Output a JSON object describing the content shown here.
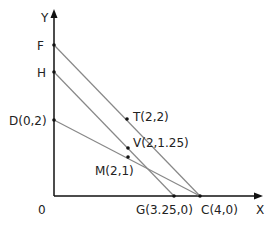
{
  "diagram": {
    "axes": {
      "x_label": "X",
      "y_label": "Y",
      "origin_label": "0"
    },
    "points": {
      "F": "F",
      "H": "H",
      "D": "D(0,2)",
      "T": "T(2,2)",
      "V": "V(2,1.25)",
      "M": "M(2,1)",
      "G": "G(3.25,0)",
      "C": "C(4,0)"
    },
    "lines": [
      {
        "name": "FC",
        "from": "F",
        "to": "C"
      },
      {
        "name": "HG",
        "from": "H",
        "to": "G"
      },
      {
        "name": "DC",
        "from": "D",
        "to": "C"
      }
    ],
    "colors": {
      "axis": "#111111",
      "line": "#888888",
      "point": "#111111"
    }
  }
}
